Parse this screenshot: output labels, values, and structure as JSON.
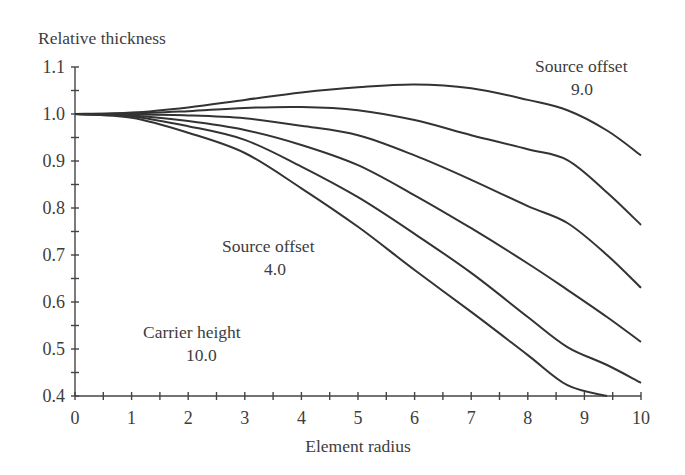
{
  "chart_data": {
    "type": "line",
    "title": "",
    "xlabel": "Element radius",
    "ylabel": "Relative thickness",
    "xlim": [
      0,
      10
    ],
    "ylim": [
      0.4,
      1.1
    ],
    "grid": false,
    "legend": null,
    "x_ticks": [
      "0",
      "1",
      "2",
      "3",
      "4",
      "5",
      "6",
      "7",
      "8",
      "9",
      "10"
    ],
    "y_ticks": [
      "0.4",
      "0.5",
      "0.6",
      "0.7",
      "0.8",
      "0.9",
      "1.0",
      "1.1"
    ],
    "x": [
      0,
      1,
      2,
      3,
      4,
      5,
      6,
      7,
      8,
      8.7,
      9.4,
      10
    ],
    "series": [
      {
        "name": "Source offset 9.0",
        "values": [
          1.0,
          1.003,
          1.014,
          1.03,
          1.046,
          1.057,
          1.063,
          1.055,
          1.03,
          1.008,
          0.965,
          0.912
        ]
      },
      {
        "name": "curve 2",
        "values": [
          1.0,
          1.001,
          1.006,
          1.013,
          1.015,
          1.008,
          0.987,
          0.955,
          0.925,
          0.902,
          0.833,
          0.764
        ]
      },
      {
        "name": "curve 3",
        "values": [
          1.0,
          0.999,
          0.997,
          0.991,
          0.975,
          0.955,
          0.912,
          0.86,
          0.804,
          0.768,
          0.7,
          0.63
        ]
      },
      {
        "name": "Source offset 4.0",
        "values": [
          1.0,
          0.997,
          0.985,
          0.966,
          0.934,
          0.891,
          0.827,
          0.757,
          0.682,
          0.626,
          0.568,
          0.515
        ]
      },
      {
        "name": "curve 5",
        "values": [
          1.0,
          0.995,
          0.974,
          0.945,
          0.888,
          0.823,
          0.745,
          0.662,
          0.568,
          0.504,
          0.466,
          0.428
        ]
      },
      {
        "name": "Carrier height 10.0",
        "values": [
          1.0,
          0.992,
          0.96,
          0.917,
          0.842,
          0.76,
          0.668,
          0.579,
          0.487,
          0.423,
          0.4,
          null
        ]
      }
    ],
    "annotations": [
      {
        "text": "Source offset",
        "sub": "9.0"
      },
      {
        "text": "Source offset",
        "sub": "4.0"
      },
      {
        "text": "Carrier height",
        "sub": "10.0"
      }
    ]
  },
  "labels": {
    "ylabel": "Relative thickness",
    "xlabel": "Element radius",
    "annot_top_line1": "Source offset",
    "annot_top_line2": "9.0",
    "annot_mid_line1": "Source offset",
    "annot_mid_line2": "4.0",
    "annot_low_line1": "Carrier height",
    "annot_low_line2": "10.0"
  }
}
